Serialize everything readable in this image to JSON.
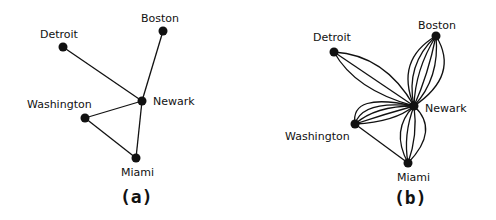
{
  "panels": [
    {
      "id": "a",
      "caption": "(a)",
      "nodes": [
        {
          "name": "Detroit",
          "x": 63,
          "y": 47
        },
        {
          "name": "Boston",
          "x": 163,
          "y": 31
        },
        {
          "name": "Newark",
          "x": 142,
          "y": 101
        },
        {
          "name": "Washington",
          "x": 85,
          "y": 118
        },
        {
          "name": "Miami",
          "x": 136,
          "y": 158
        }
      ],
      "edges": [
        [
          "Detroit",
          "Newark"
        ],
        [
          "Boston",
          "Newark"
        ],
        [
          "Washington",
          "Newark"
        ],
        [
          "Miami",
          "Newark"
        ],
        [
          "Washington",
          "Miami"
        ]
      ]
    },
    {
      "id": "b",
      "caption": "(b)",
      "nodes": [
        {
          "name": "Detroit",
          "x": 334,
          "y": 52
        },
        {
          "name": "Boston",
          "x": 436,
          "y": 36
        },
        {
          "name": "Newark",
          "x": 414,
          "y": 106
        },
        {
          "name": "Washington",
          "x": 355,
          "y": 124
        },
        {
          "name": "Miami",
          "x": 408,
          "y": 163
        }
      ],
      "bundles": [
        {
          "from": "Detroit",
          "to": "Newark",
          "count": 3
        },
        {
          "from": "Boston",
          "to": "Newark",
          "count": 6
        },
        {
          "from": "Washington",
          "to": "Newark",
          "count": 5
        },
        {
          "from": "Miami",
          "to": "Newark",
          "count": 4
        },
        {
          "from": "Washington",
          "to": "Miami",
          "count": 1
        }
      ]
    }
  ],
  "labels": {
    "a": {
      "detroit": "Detroit",
      "boston": "Boston",
      "newark": "Newark",
      "washington": "Washington",
      "miami": "Miami"
    },
    "b": {
      "detroit": "Detroit",
      "boston": "Boston",
      "newark": "Newark",
      "washington": "Washington",
      "miami": "Miami"
    }
  },
  "captions": {
    "a": "(a)",
    "b": "(b)"
  }
}
